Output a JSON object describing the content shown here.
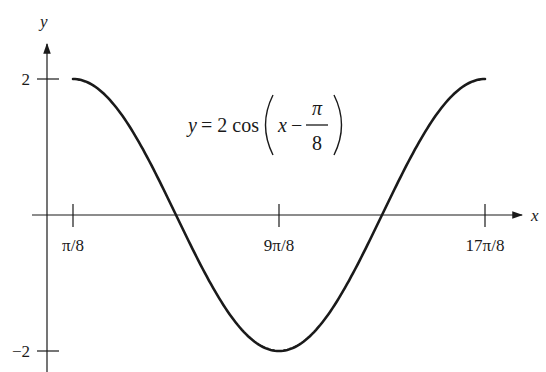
{
  "chart_data": {
    "type": "line",
    "title": "",
    "equation": {
      "lhs": "y = 2 cos",
      "inner_var": "x",
      "minus": "−",
      "frac_num": "π",
      "frac_den": "8"
    },
    "xlabel": "x",
    "ylabel": "y",
    "x_ticks": [
      {
        "label": "π/8",
        "value": 0.3927
      },
      {
        "label": "9π/8",
        "value": 3.5343
      },
      {
        "label": "17π/8",
        "value": 6.6759
      }
    ],
    "y_ticks": [
      {
        "label": "2",
        "value": 2
      },
      {
        "label": "−2",
        "value": -2
      }
    ],
    "series": [
      {
        "name": "y = 2cos(x − π/8)",
        "x": [
          0.3927,
          1.1781,
          1.9635,
          2.7489,
          3.5343,
          4.3197,
          5.1051,
          5.8905,
          6.6759
        ],
        "y": [
          2,
          1.414,
          0,
          -1.414,
          -2,
          -1.414,
          0,
          1.414,
          2
        ]
      }
    ],
    "xlim": [
      0.3927,
      6.6759
    ],
    "ylim": [
      -2,
      2
    ],
    "grid": false,
    "legend": null
  }
}
